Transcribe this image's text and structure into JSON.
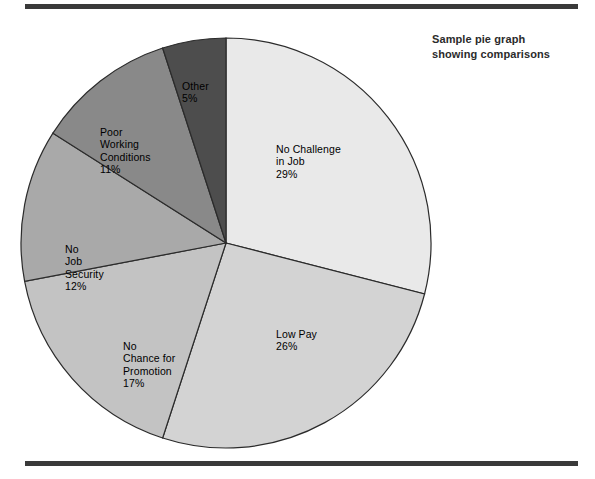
{
  "title": {
    "line1": "Sample pie graph",
    "line2": "showing comparisons"
  },
  "figure": {
    "top_rule": "horizontal-rule",
    "bottom_rule": "horizontal-rule"
  },
  "chart_data": {
    "type": "pie",
    "title": "Sample pie graph showing comparisons",
    "start_angle_deg": 0,
    "direction": "clockwise",
    "units": "percent",
    "total": 100,
    "categories": [
      "No Challenge in Job",
      "Low Pay",
      "No Chance for Promotion",
      "No Job Security",
      "Poor Working Conditions",
      "Other"
    ],
    "values": [
      29,
      26,
      17,
      12,
      11,
      5
    ],
    "colors": [
      "#e9e9e9",
      "#d3d3d3",
      "#c3c3c3",
      "#a9a9a9",
      "#898989",
      "#4d4d4d"
    ],
    "slice_stroke": "#2b2b2b",
    "legend": "none",
    "grid": false,
    "slices": [
      {
        "name": "no-challenge-in-job",
        "label_lines": [
          "No Challenge",
          "in Job"
        ],
        "value_label": "29%",
        "value": 29,
        "color": "#e9e9e9"
      },
      {
        "name": "low-pay",
        "label_lines": [
          "Low Pay"
        ],
        "value_label": "26%",
        "value": 26,
        "color": "#d3d3d3"
      },
      {
        "name": "no-chance-for-promotion",
        "label_lines": [
          "No",
          "Chance for",
          "Promotion"
        ],
        "value_label": "17%",
        "value": 17,
        "color": "#c3c3c3"
      },
      {
        "name": "no-job-security",
        "label_lines": [
          "No",
          "Job",
          "Security"
        ],
        "value_label": "12%",
        "value": 12,
        "color": "#a9a9a9"
      },
      {
        "name": "poor-working-conditions",
        "label_lines": [
          "Poor",
          "Working",
          "Conditions"
        ],
        "value_label": "11%",
        "value": 11,
        "color": "#898989"
      },
      {
        "name": "other",
        "label_lines": [
          "Other"
        ],
        "value_label": "5%",
        "value": 5,
        "color": "#4d4d4d"
      }
    ]
  },
  "labels": {
    "no_challenge": "No Challenge\nin Job\n29%",
    "low_pay": "Low Pay\n26%",
    "no_chance": "No\nChance for\nPromotion\n17%",
    "no_job_security": "No\nJob\nSecurity\n12%",
    "poor_working": "Poor\nWorking\nConditions\n11%",
    "other": "Other\n5%"
  }
}
